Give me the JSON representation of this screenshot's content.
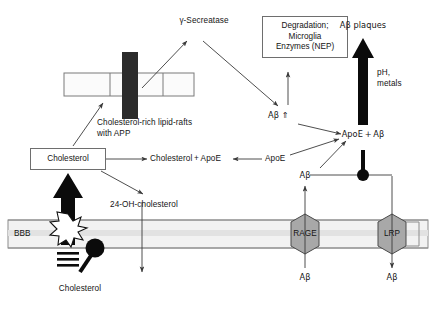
{
  "figure": {
    "colors": {
      "stroke": "#4d4d4d",
      "text": "#141414",
      "app_bar": "#2b2b2b",
      "receptor_fill": "#a8a8a8",
      "membrane_fill": "#f2f2f2",
      "raft_fill": "#fbfbfb",
      "black": "#000000"
    }
  },
  "nodes": {
    "secretase": "γ-Secreatase",
    "degradation_box": {
      "line1": "Degradation;",
      "line2": "Microglia",
      "line3": "Enzymes (NEP)"
    },
    "abeta_up": "Aβ ⇑",
    "abeta_plaques": "Aβ plaques",
    "ph_metals": {
      "line1": "pH,",
      "line2": "metals"
    },
    "apoe_abeta": "ApoE + Aβ",
    "raft_label": {
      "line1": "Cholesterol-rich lipid-rafts",
      "line2": "with APP"
    },
    "cholesterol_box": "Cholesterol",
    "cholesterol_apoe": "Cholesterol + ApoE",
    "apoe": "ApoE",
    "oh_cholesterol": "24-OH-cholesterol",
    "bbb": "BBB",
    "cholesterol_bottom": "Cholesterol",
    "rage": "RAGE",
    "lrp": "LRP",
    "abeta_rage_in": "Aβ",
    "abeta_rage_out": "Aβ",
    "abeta_lrp_out": "Aβ"
  }
}
